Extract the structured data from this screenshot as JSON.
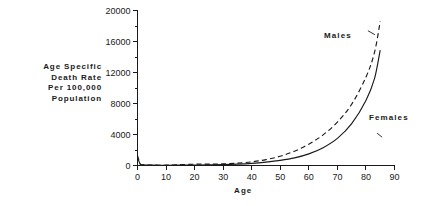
{
  "chart_data": {
    "type": "line",
    "title": "",
    "subtitle": "",
    "xlabel": "Age",
    "ylabel": "Age Specific Death Rate Per 100,000 Population",
    "ylabel_lines": [
      "Age Specific",
      "Death Rate",
      "Per 100,000",
      "Population"
    ],
    "xlim": [
      0,
      90
    ],
    "ylim": [
      0,
      20000
    ],
    "xticks": [
      0,
      10,
      20,
      30,
      40,
      50,
      60,
      70,
      80,
      90
    ],
    "xtick_labels": [
      "0",
      "10",
      "20",
      "30",
      "40",
      "50",
      "60",
      "70",
      "80",
      "90"
    ],
    "yticks": [
      0,
      4000,
      8000,
      12000,
      16000,
      20000
    ],
    "ytick_labels": [
      "0",
      "4000",
      "8000",
      "12000",
      "16000",
      "20000"
    ],
    "y_minor_ticks": [
      2000,
      6000,
      10000,
      14000,
      18000
    ],
    "grid": false,
    "legend_position": "inline-annotation",
    "line_color": "#1a1a1a",
    "background_color": "#ffffff",
    "annotations": [
      {
        "text": "Males",
        "points_to_series": "Males",
        "x": 80,
        "y": 17200
      },
      {
        "text": "Females",
        "points_to_series": "Females",
        "x": 86,
        "y": 4300
      }
    ],
    "series": [
      {
        "name": "Males",
        "style": "dashed",
        "x": [
          0,
          1,
          2,
          5,
          10,
          15,
          20,
          25,
          30,
          35,
          40,
          45,
          50,
          55,
          60,
          65,
          70,
          75,
          80,
          83,
          85
        ],
        "values": [
          1300,
          180,
          95,
          50,
          40,
          110,
          170,
          180,
          210,
          300,
          470,
          760,
          1200,
          1850,
          2750,
          3950,
          5600,
          7900,
          11400,
          14600,
          18600
        ]
      },
      {
        "name": "Females",
        "style": "solid",
        "x": [
          0,
          1,
          2,
          5,
          10,
          15,
          20,
          25,
          30,
          35,
          40,
          45,
          50,
          55,
          60,
          65,
          70,
          75,
          80,
          83,
          85
        ],
        "values": [
          1050,
          150,
          80,
          40,
          30,
          50,
          65,
          80,
          110,
          175,
          280,
          440,
          660,
          980,
          1500,
          2300,
          3500,
          5400,
          8400,
          11200,
          14900
        ]
      }
    ]
  },
  "figure": {
    "xaxis_title": "Age",
    "yaxis_title_line1": "Age Specific",
    "yaxis_title_line2": "Death Rate",
    "yaxis_title_line3": "Per 100,000",
    "yaxis_title_line4": "Population",
    "label_males": "Males",
    "label_females": "Females"
  }
}
